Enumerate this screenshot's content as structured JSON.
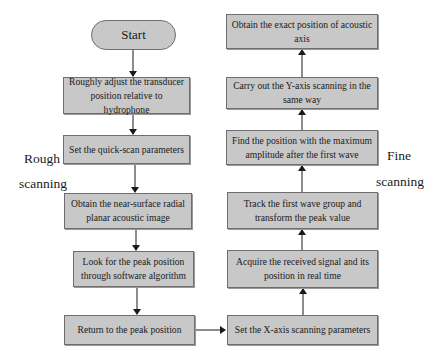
{
  "diagram": {
    "type": "flowchart",
    "start": {
      "label": "Start"
    },
    "rough_label": {
      "line1": "Rough",
      "line2": "scanning"
    },
    "fine_label": {
      "line1": "Fine",
      "line2": "scanning"
    },
    "rough_steps": [
      {
        "label": "Roughly adjust the transducer position relative to hydrophone"
      },
      {
        "label": "Set the quick-scan parameters"
      },
      {
        "label": "Obtain the near-surface radial planar acoustic image"
      },
      {
        "label": "Look for the peak position through software algorithm"
      },
      {
        "label": "Return to the peak position"
      }
    ],
    "fine_steps": [
      {
        "label": "Set the X-axis scanning parameters"
      },
      {
        "label": "Acquire the received signal and its position in real time"
      },
      {
        "label": "Track the first wave group and transform the peak value"
      },
      {
        "label": "Find the position with the maximum amplitude after the first wave"
      },
      {
        "label": "Carry out the Y-axis scanning in the same way"
      },
      {
        "label": "Obtain the exact position of acoustic axis"
      }
    ],
    "colors": {
      "box_fill": "#c8c8c8",
      "box_border": "#6e6e6e",
      "arrow": "#1a1a1a",
      "background": "#ffffff"
    }
  }
}
